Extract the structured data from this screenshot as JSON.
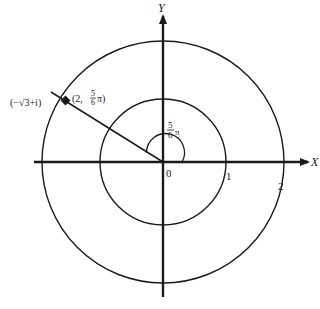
{
  "diagram": {
    "type": "polar-coordinate-plot",
    "axes": {
      "x_label": "X",
      "y_label": "Y",
      "origin_label": "0"
    },
    "circles": [
      {
        "radius_label": "1"
      },
      {
        "radius_label": "2"
      }
    ],
    "point": {
      "cartesian_label": "(−√3+i)",
      "polar_label_prefix": "(2, ",
      "polar_angle_num": "5",
      "polar_angle_den": "6",
      "polar_angle_suffix": "π)"
    },
    "angle": {
      "num": "5",
      "den": "6",
      "suffix": "π"
    },
    "colors": {
      "ink": "#1a1a1a",
      "background": "#ffffff"
    }
  }
}
